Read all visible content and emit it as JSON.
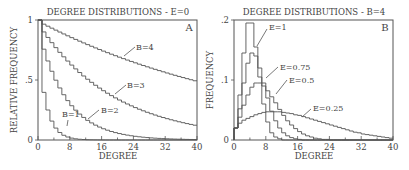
{
  "chart_data": [
    {
      "type": "line",
      "panel": "A",
      "title": "DEGREE DISTRIBUTIONS - E=0",
      "xlabel": "DEGREE",
      "ylabel": "RELATIVE FREQUENCY",
      "xlim": [
        0,
        40
      ],
      "ylim": [
        0,
        1
      ],
      "xticks": [
        "0",
        "8",
        "16",
        "24",
        "32",
        "40"
      ],
      "yticks": [
        "0",
        ".5",
        "1"
      ],
      "grid": false,
      "step": true,
      "series": [
        {
          "name": "B=1",
          "decay": 0.63,
          "label_at": [
            5,
            0.2
          ]
        },
        {
          "name": "B=2",
          "decay": 0.87,
          "label_at": [
            14,
            0.27
          ]
        },
        {
          "name": "B=3",
          "decay": 0.949,
          "label_at": [
            20,
            0.43
          ]
        },
        {
          "name": "B=4",
          "decay": 0.9825,
          "label_at": [
            22,
            0.72
          ]
        }
      ]
    },
    {
      "type": "line",
      "panel": "B",
      "title": "DEGREE DISTRIBUTIONS - B=4",
      "xlabel": "DEGREE",
      "ylabel": "FREQUENCY",
      "xlim": [
        0,
        40
      ],
      "ylim": [
        0,
        0.2
      ],
      "xticks": [
        "0",
        "8",
        "16",
        "24",
        "32",
        "40"
      ],
      "yticks": [
        "0",
        ".1",
        ".2"
      ],
      "grid": false,
      "step": true,
      "series": [
        {
          "name": "E=1",
          "values": [
            0.02,
            0.075,
            0.145,
            0.195,
            0.195,
            0.155,
            0.105,
            0.06,
            0.03,
            0.012,
            0.005,
            0.002,
            0.0,
            0,
            0,
            0,
            0,
            0,
            0,
            0,
            0,
            0,
            0,
            0,
            0,
            0,
            0,
            0,
            0,
            0,
            0,
            0,
            0,
            0,
            0,
            0,
            0,
            0,
            0,
            0
          ]
        },
        {
          "name": "E=0.75",
          "values": [
            0.02,
            0.052,
            0.095,
            0.128,
            0.145,
            0.14,
            0.12,
            0.095,
            0.07,
            0.048,
            0.032,
            0.02,
            0.012,
            0.007,
            0.004,
            0.002,
            0.001,
            0,
            0,
            0,
            0,
            0,
            0,
            0,
            0,
            0,
            0,
            0,
            0,
            0,
            0,
            0,
            0,
            0,
            0,
            0,
            0,
            0,
            0,
            0
          ]
        },
        {
          "name": "E=0.5",
          "values": [
            0.02,
            0.038,
            0.058,
            0.075,
            0.088,
            0.095,
            0.095,
            0.09,
            0.082,
            0.072,
            0.062,
            0.051,
            0.041,
            0.032,
            0.025,
            0.019,
            0.014,
            0.01,
            0.007,
            0.005,
            0.003,
            0.002,
            0.001,
            0.001,
            0,
            0,
            0,
            0,
            0,
            0,
            0,
            0,
            0,
            0,
            0,
            0,
            0,
            0,
            0,
            0
          ]
        },
        {
          "name": "E=0.25",
          "values": [
            0.02,
            0.028,
            0.033,
            0.036,
            0.039,
            0.042,
            0.044,
            0.046,
            0.047,
            0.047,
            0.047,
            0.047,
            0.046,
            0.045,
            0.044,
            0.042,
            0.041,
            0.039,
            0.037,
            0.035,
            0.033,
            0.031,
            0.029,
            0.027,
            0.025,
            0.023,
            0.021,
            0.019,
            0.017,
            0.015,
            0.013,
            0.012,
            0.01,
            0.009,
            0.008,
            0.007,
            0.006,
            0.005,
            0.004,
            0.003
          ]
        }
      ]
    }
  ],
  "panelA": {
    "title": "DEGREE DISTRIBUTIONS - E=0",
    "letter": "A",
    "xlabel": "DEGREE",
    "ylabel": "RELATIVE FREQUENCY",
    "xticks": [
      "0",
      "8",
      "16",
      "24",
      "32",
      "40"
    ],
    "yticks": [
      "0",
      ".5",
      "1"
    ],
    "labels": [
      "B=1",
      "B=2",
      "B=3",
      "B=4"
    ]
  },
  "panelB": {
    "title": "DEGREE DISTRIBUTIONS - B=4",
    "letter": "B",
    "xlabel": "DEGREE",
    "ylabel": "FREQUENCY",
    "xticks": [
      "0",
      "8",
      "16",
      "24",
      "32",
      "40"
    ],
    "yticks": [
      "0",
      ".1",
      ".2"
    ],
    "labels": [
      "E=1",
      "E=0.75",
      "E=0.5",
      "E=0.25"
    ]
  }
}
